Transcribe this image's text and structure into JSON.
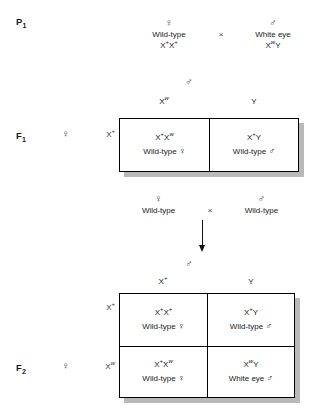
{
  "figure": {
    "type": "genetic-cross-diagram",
    "symbols": {
      "female": "♀",
      "male": "♂",
      "cross": "×"
    },
    "colors": {
      "line": "#000000",
      "shadow": "#b9b9b9",
      "text": "#1a1a1a",
      "background": "#ffffff"
    }
  },
  "p1": {
    "label": "P",
    "label_sub": "1",
    "female_parent": {
      "sex_symbol": "♀",
      "phenotype": "Wild-type",
      "genotype_parts": [
        {
          "base": "X",
          "sup": "+",
          "italic": false
        },
        {
          "base": "X",
          "sup": "+",
          "italic": false
        }
      ]
    },
    "cross_symbol": "×",
    "male_parent": {
      "sex_symbol": "♂",
      "phenotype": "White eye",
      "genotype_parts": [
        {
          "base": "X",
          "sup": "w",
          "italic": true
        },
        {
          "base": "Y",
          "sup": "",
          "italic": false
        }
      ]
    }
  },
  "f1": {
    "label": "F",
    "label_sub": "1",
    "row_axis_symbol": "♀",
    "col_axis_symbol": "♂",
    "col_headers": [
      {
        "base": "X",
        "sup": "w",
        "italic": true
      },
      {
        "base": "Y",
        "sup": "",
        "italic": false
      }
    ],
    "row_headers": [
      {
        "base": "X",
        "sup": "+",
        "italic": false
      }
    ],
    "cells": [
      [
        {
          "genotype_parts": [
            {
              "base": "X",
              "sup": "+",
              "italic": false
            },
            {
              "base": "X",
              "sup": "w",
              "italic": true
            }
          ],
          "phenotype": "Wild-type",
          "sex_symbol": "♀"
        },
        {
          "genotype_parts": [
            {
              "base": "X",
              "sup": "+",
              "italic": false
            },
            {
              "base": "Y",
              "sup": "",
              "italic": false
            }
          ],
          "phenotype": "Wild-type",
          "sex_symbol": "♂"
        }
      ]
    ]
  },
  "f1_cross": {
    "female_parent": {
      "sex_symbol": "♀",
      "phenotype": "Wild-type"
    },
    "cross_symbol": "×",
    "male_parent": {
      "sex_symbol": "♂",
      "phenotype": "Wild-type"
    }
  },
  "f2": {
    "label": "F",
    "label_sub": "2",
    "row_axis_symbol": "♀",
    "col_axis_symbol": "♂",
    "col_headers": [
      {
        "base": "X",
        "sup": "+",
        "italic": false
      },
      {
        "base": "Y",
        "sup": "",
        "italic": false
      }
    ],
    "row_headers": [
      {
        "base": "X",
        "sup": "+",
        "italic": false
      },
      {
        "base": "X",
        "sup": "w",
        "italic": true
      }
    ],
    "cells": [
      [
        {
          "genotype_parts": [
            {
              "base": "X",
              "sup": "+",
              "italic": false
            },
            {
              "base": "X",
              "sup": "+",
              "italic": false
            }
          ],
          "phenotype": "Wild-type",
          "sex_symbol": "♀"
        },
        {
          "genotype_parts": [
            {
              "base": "X",
              "sup": "+",
              "italic": false
            },
            {
              "base": "Y",
              "sup": "",
              "italic": false
            }
          ],
          "phenotype": "Wild-type",
          "sex_symbol": "♂"
        }
      ],
      [
        {
          "genotype_parts": [
            {
              "base": "X",
              "sup": "+",
              "italic": false
            },
            {
              "base": "X",
              "sup": "w",
              "italic": true
            }
          ],
          "phenotype": "Wild-type",
          "sex_symbol": "♀"
        },
        {
          "genotype_parts": [
            {
              "base": "X",
              "sup": "w",
              "italic": true
            },
            {
              "base": "Y",
              "sup": "",
              "italic": false
            }
          ],
          "phenotype": "White eye",
          "sex_symbol": "♂"
        }
      ]
    ]
  }
}
